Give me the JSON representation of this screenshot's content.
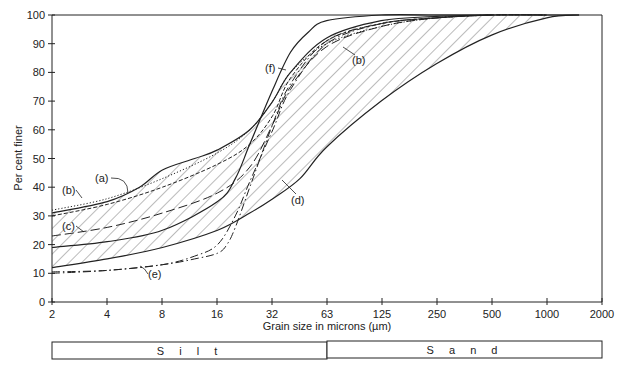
{
  "chart_data": {
    "type": "line",
    "title": "",
    "xlabel": "Grain size in microns (µm)",
    "ylabel": "Per cent finer",
    "x_scale": "log2",
    "x_ticks": [
      "2",
      "4",
      "8",
      "16",
      "32",
      "63",
      "125",
      "250",
      "500",
      "1000",
      "2000"
    ],
    "y_ticks": [
      "0",
      "10",
      "20",
      "30",
      "40",
      "50",
      "60",
      "70",
      "80",
      "90",
      "100"
    ],
    "xlim": [
      2,
      2000
    ],
    "ylim": [
      0,
      100
    ],
    "grid": false,
    "envelope": {
      "description": "Hatched envelope between upper and lower bounding curves",
      "upper": {
        "x": [
          2,
          4,
          6,
          8,
          12,
          16,
          24,
          32,
          40,
          63,
          125,
          250,
          500,
          1000,
          1500
        ],
        "y": [
          31,
          35,
          40,
          46,
          50,
          53,
          60,
          70,
          80,
          92,
          98,
          99.5,
          100,
          100,
          100
        ]
      },
      "lower": {
        "x": [
          2,
          4,
          8,
          16,
          24,
          32,
          45,
          63,
          125,
          250,
          500,
          1000,
          1500
        ],
        "y": [
          12,
          15,
          19,
          25,
          31,
          36,
          43,
          54,
          70,
          83,
          93,
          99,
          100
        ]
      }
    },
    "series": [
      {
        "name": "(a)",
        "style": "dashed",
        "x": [
          2,
          4,
          8,
          16,
          24,
          32,
          40,
          63,
          125,
          250,
          500,
          1000
        ],
        "y": [
          30,
          34,
          40,
          48,
          55,
          65,
          78,
          91,
          97,
          99,
          100,
          100
        ]
      },
      {
        "name": "(b)",
        "style": "dotted",
        "x": [
          2,
          4,
          8,
          16,
          24,
          32,
          40,
          63,
          125,
          250,
          500,
          1000
        ],
        "y": [
          32,
          36,
          43,
          52,
          60,
          70,
          80,
          90,
          96,
          99,
          100,
          100
        ]
      },
      {
        "name": "(c)",
        "style": "long-dash",
        "x": [
          2,
          4,
          8,
          16,
          24,
          32,
          40,
          63,
          125,
          250,
          500,
          1000
        ],
        "y": [
          23,
          26,
          31,
          38,
          47,
          62,
          75,
          89,
          96,
          99,
          100,
          100
        ]
      },
      {
        "name": "(d)",
        "style": "dash-dot",
        "x": [
          2,
          4,
          8,
          12,
          16,
          20,
          24,
          32,
          40,
          63,
          125,
          250,
          500
        ],
        "y": [
          10,
          11,
          13,
          16,
          20,
          30,
          42,
          60,
          74,
          90,
          97,
          99,
          100
        ]
      },
      {
        "name": "(e)",
        "style": "dash-dot",
        "x": [
          2,
          4,
          8,
          12,
          16,
          20,
          24,
          32,
          40,
          63,
          125,
          250,
          500
        ],
        "y": [
          10,
          11,
          13,
          16,
          20,
          30,
          42,
          60,
          74,
          90,
          97,
          99,
          100
        ]
      },
      {
        "name": "(f)",
        "style": "solid",
        "x": [
          2,
          4,
          8,
          16,
          20,
          24,
          32,
          40,
          50,
          63,
          125,
          250,
          500
        ],
        "y": [
          19,
          21,
          25,
          35,
          43,
          55,
          74,
          87,
          94,
          98,
          100,
          100,
          100
        ]
      }
    ],
    "annotations": [
      "(a)",
      "(b)",
      "(b)",
      "(c)",
      "(d)",
      "(e)",
      "(f)"
    ],
    "size_classes": [
      {
        "label": "Silt",
        "from": 2,
        "to": 63
      },
      {
        "label": "Sand",
        "from": 63,
        "to": 2000
      }
    ]
  },
  "labels": {
    "xlabel": "Grain size in microns (µm)",
    "ylabel": "Per cent finer",
    "silt": "S i l t",
    "sand": "S a n d",
    "a": "(a)",
    "b": "(b)",
    "b2": "(b)",
    "c": "(c)",
    "d": "(d)",
    "e": "(e)",
    "f": "(f)"
  }
}
